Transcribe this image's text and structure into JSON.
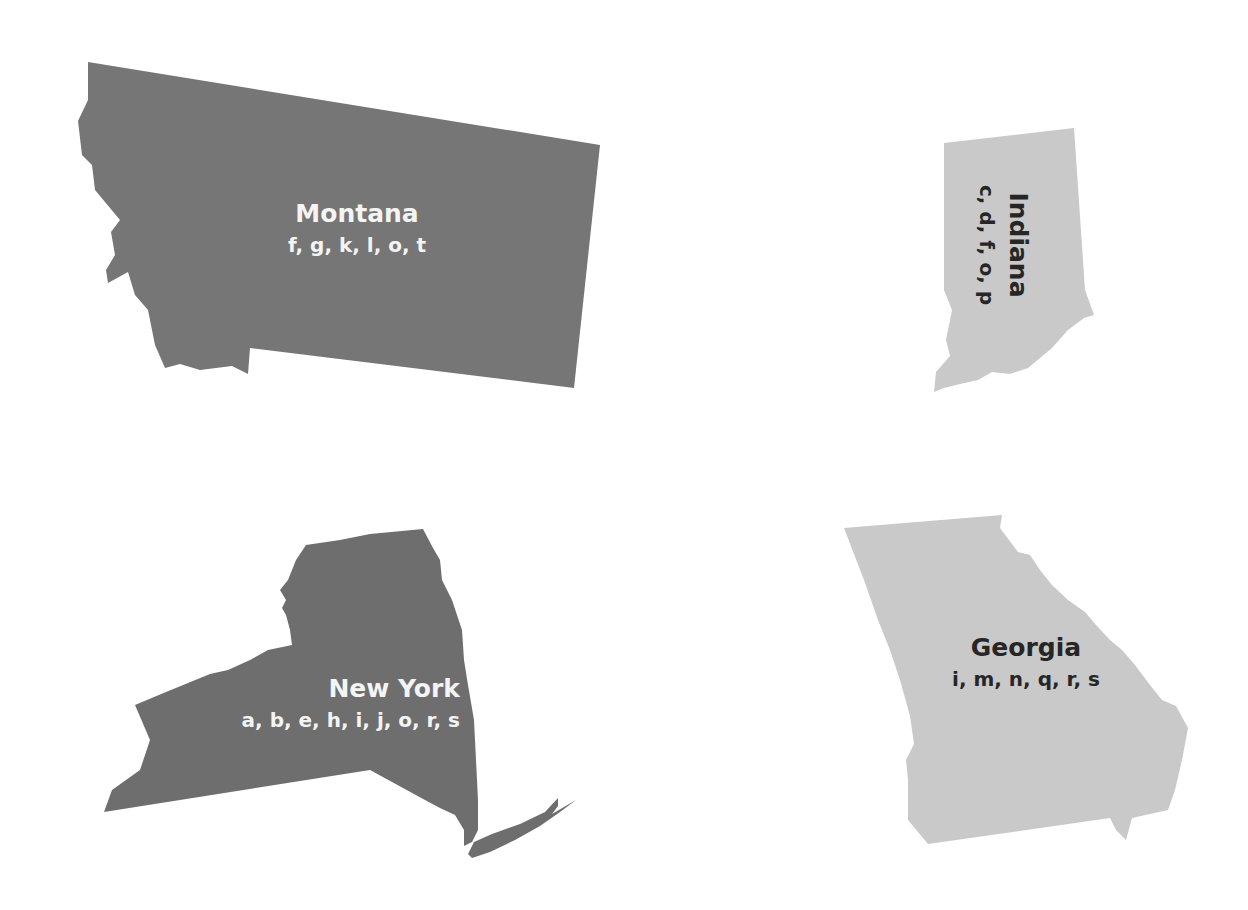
{
  "colors": {
    "background": "#ffffff",
    "dark_state": "#767676",
    "dark_state_ny": "#6e6e6e",
    "light_state": "#c9c9c9",
    "light_text": "#f4f4f4",
    "dark_text": "#262626"
  },
  "states": [
    {
      "id": "montana",
      "name": "Montana",
      "letters": "f, g, k, l, o, t",
      "shade": "dark"
    },
    {
      "id": "indiana",
      "name": "Indiana",
      "letters": "c, d, f, o, p",
      "shade": "light",
      "label_rotation_deg": 90
    },
    {
      "id": "new-york",
      "name": "New York",
      "letters": "a, b, e, h, i, j, o, r, s",
      "shade": "dark"
    },
    {
      "id": "georgia",
      "name": "Georgia",
      "letters": "i, m, n, q, r, s",
      "shade": "light"
    }
  ]
}
